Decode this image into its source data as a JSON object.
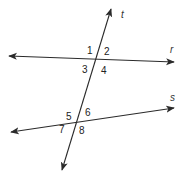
{
  "diagram": {
    "type": "parallel-lines-cut-by-transversal",
    "lines": [
      {
        "name": "r",
        "label": "r",
        "x1": 9,
        "y1": 56,
        "x2": 174,
        "y2": 62
      },
      {
        "name": "s",
        "label": "s",
        "x1": 11,
        "y1": 132,
        "x2": 174,
        "y2": 108
      },
      {
        "name": "t",
        "label": "t",
        "x1": 111,
        "y1": 9,
        "x2": 62,
        "y2": 170
      }
    ],
    "line_labels": {
      "r": {
        "text": "r",
        "x": 170,
        "y": 53
      },
      "s": {
        "text": "s",
        "x": 170,
        "y": 101
      },
      "t": {
        "text": "t",
        "x": 121,
        "y": 18
      }
    },
    "angles": [
      {
        "id": "1",
        "text": "1",
        "x": 87,
        "y": 54
      },
      {
        "id": "2",
        "text": "2",
        "x": 104,
        "y": 55
      },
      {
        "id": "3",
        "text": "3",
        "x": 82,
        "y": 73
      },
      {
        "id": "4",
        "text": "4",
        "x": 101,
        "y": 74
      },
      {
        "id": "5",
        "text": "5",
        "x": 66,
        "y": 120
      },
      {
        "id": "6",
        "text": "6",
        "x": 85,
        "y": 116
      },
      {
        "id": "7",
        "text": "7",
        "x": 59,
        "y": 133
      },
      {
        "id": "8",
        "text": "8",
        "x": 79,
        "y": 134
      }
    ],
    "colors": {
      "stroke": "#2a2a2a",
      "text": "#222222",
      "background": "#ffffff"
    }
  }
}
